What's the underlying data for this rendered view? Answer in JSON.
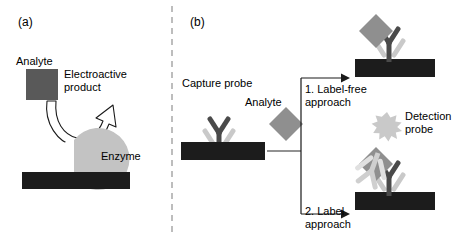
{
  "figure": {
    "type": "diagram",
    "background": "#ffffff",
    "width": 467,
    "height": 241
  },
  "colors": {
    "electrode_dark": "#1c1c1c",
    "analyte_gray": "#595959",
    "analyte_mid": "#8c8c8c",
    "enzyme_light": "#c3c3c3",
    "probe_light": "#cfcfcf",
    "probe_dark": "#6e6e6e",
    "line_black": "#000000",
    "divider_gray": "#9a9a9a",
    "text": "#000000"
  },
  "panel_a": {
    "tag": "(a)",
    "labels": {
      "analyte": "Analyte",
      "electroactive_product": "Electroactive\nproduct",
      "enzyme": "Enzyme"
    },
    "shapes": {
      "analyte_square": "analyte-square",
      "enzyme_pacman": "enzyme-pacman",
      "electrode_bar": "electrode-bar",
      "reaction_arrow": "curved-reaction-arrow"
    }
  },
  "panel_b": {
    "tag": "(b)",
    "labels": {
      "capture_probe": "Capture probe",
      "analyte": "Analyte",
      "branch_1": "1. Label-free\napproach",
      "branch_2": "2. Label\napproach",
      "detection_probe": "Detection\nprobe"
    },
    "shapes": {
      "capture_antibody": "antibody-y-icon",
      "analyte_diamond": "analyte-diamond",
      "electrode_bar": "electrode-bar",
      "branch_connector": "branch-connector-lines",
      "arrow_top": "arrow-right-icon",
      "arrow_bottom": "arrow-right-icon",
      "detection_antibody": "antibody-y-icon",
      "label_star": "star-burst-icon"
    }
  }
}
